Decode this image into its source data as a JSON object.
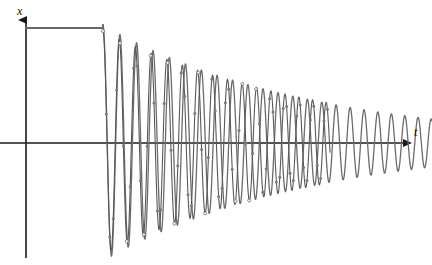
{
  "chart_data": {
    "type": "line",
    "title": "",
    "subtitle": "",
    "xlabel": "t",
    "ylabel": "x",
    "grid": false,
    "legend": null,
    "annotations": [],
    "axes": {
      "x_axis": {
        "label": "t",
        "arrow": true,
        "tick_labels": [],
        "origin_px": 26,
        "baseline_px": 143,
        "end_px": 408
      },
      "y_axis": {
        "label": "x",
        "arrow": true,
        "tick_labels": [],
        "axis_px": 26,
        "top_px": 16,
        "bottom_px": 258
      }
    },
    "series": [
      {
        "name": "step-plateau",
        "style": "solid",
        "color": "#666666",
        "markers": false,
        "points": [
          {
            "t": 26,
            "x": 115
          },
          {
            "t": 103,
            "x": 115
          }
        ]
      },
      {
        "name": "damped-oscillation-smooth",
        "style": "solid",
        "color": "#6b6b6b",
        "markers": false,
        "model": {
          "start_px": 103,
          "end_px": 432,
          "amplitude_start": 118,
          "amplitude_end": 24,
          "decay": "exponential",
          "period_start_px": 17.0,
          "period_end_px": 13.0,
          "phase": "descending-from-peak"
        }
      },
      {
        "name": "damped-oscillation-sampled",
        "style": "solid",
        "color": "#585858",
        "markers": true,
        "marker_shape": "circle",
        "marker_size_px": 3,
        "marker_fill": "#7a7a7a",
        "marker_open_at_extrema": true,
        "model": {
          "start_px": 103,
          "end_px": 330,
          "amplitude_start": 112,
          "amplitude_end": 40,
          "decay": "exponential",
          "period_start_px": 16.4,
          "period_end_px": 13.4,
          "phase": "descending-from-peak",
          "sample_step_px": 3.4
        }
      }
    ],
    "ylim": [
      -130,
      130
    ],
    "xlim": [
      0,
      432
    ],
    "colors": {
      "axis": "#1a1a1a",
      "curve_primary": "#6b6b6b",
      "curve_secondary": "#585858",
      "marker": "#7a7a7a",
      "background": "#ffffff"
    }
  },
  "labels": {
    "y_axis_label": "x",
    "x_axis_label": "t"
  }
}
